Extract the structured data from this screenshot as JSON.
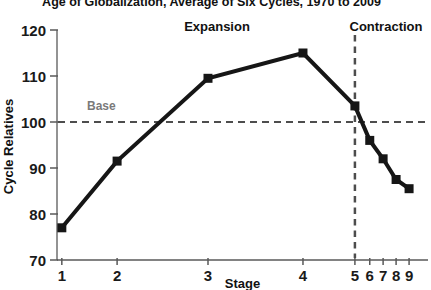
{
  "title": "Age of Globalization, Average of Six Cycles, 1970 to 2009",
  "chart_data": {
    "type": "line",
    "title": "Age of Globalization, Average of Six Cycles, 1970 to 2009",
    "xlabel": "Stage",
    "ylabel": "Cycle Relatives",
    "categories": [
      "1",
      "2",
      "3",
      "4",
      "5",
      "6",
      "7",
      "8",
      "9"
    ],
    "x_fractions": [
      0.013,
      0.162,
      0.407,
      0.663,
      0.803,
      0.843,
      0.879,
      0.914,
      0.949
    ],
    "values": [
      77,
      91.5,
      109.5,
      115,
      103.5,
      96,
      92,
      87.5,
      85.5
    ],
    "y_ticks": [
      70,
      80,
      90,
      100,
      110,
      120
    ],
    "ylim": [
      70,
      120
    ],
    "grid": false,
    "legend": "none",
    "annotations": {
      "expansion_label": "Expansion",
      "contraction_label": "Contraction",
      "base_label": "Base",
      "base_value": 100,
      "divider_stage": "5"
    },
    "colors": {
      "line": "#161616",
      "axis": "#595959",
      "dashed": "#4d4d4d",
      "text": "#1a1a1a",
      "base_text": "#7a7a7a"
    }
  }
}
